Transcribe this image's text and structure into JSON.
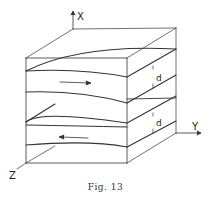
{
  "figure": {
    "caption": "Fig. 13",
    "axes": {
      "x_label": "X",
      "y_label": "Y",
      "z_label": "Z"
    },
    "layers": [
      {
        "name": "upper-layer",
        "thickness_label": "d",
        "flow_direction": "right"
      },
      {
        "name": "lower-layer",
        "thickness_label": "d",
        "flow_direction": "left"
      }
    ],
    "colors": {
      "line": "#333333",
      "background": "#ffffff"
    }
  }
}
